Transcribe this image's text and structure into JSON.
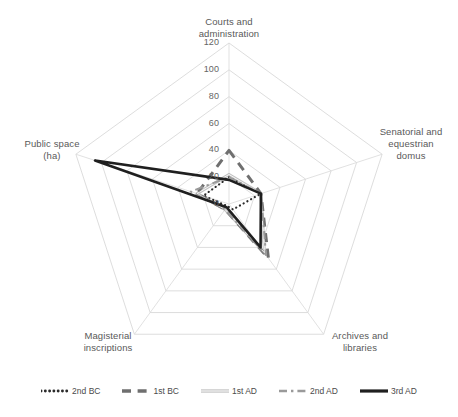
{
  "chart_data": {
    "type": "radar",
    "title": "",
    "categories": [
      "Courts and administration",
      "Senatorial and equestrian domus",
      "Archives and libraries",
      "Magisterial inscriptions",
      "Public space (ha)"
    ],
    "tick_labels": [
      "0",
      "20",
      "40",
      "60",
      "80",
      "100",
      "120"
    ],
    "rmin": 0,
    "rmax": 120,
    "rstep": 20,
    "grid": true,
    "legend_position": "bottom",
    "series": [
      {
        "name": "2nd BC",
        "style": "dotted",
        "color": "#2b2b2b",
        "width": 2.2,
        "values": [
          20,
          25,
          5,
          2,
          20
        ]
      },
      {
        "name": "1st BC",
        "style": "dashed",
        "color": "#6f6f6f",
        "width": 3.0,
        "values": [
          40,
          25,
          50,
          5,
          25
        ]
      },
      {
        "name": "1st AD",
        "style": "solid-thin",
        "color": "#8f8f8f",
        "width": 1.6,
        "values": [
          22,
          25,
          45,
          5,
          25
        ]
      },
      {
        "name": "2nd AD",
        "style": "dash-dot",
        "color": "#9a9a9a",
        "width": 2.0,
        "values": [
          20,
          25,
          47,
          5,
          30
        ]
      },
      {
        "name": "3rd AD",
        "style": "solid-thick",
        "color": "#1f1f1f",
        "width": 2.6,
        "values": [
          18,
          25,
          40,
          3,
          105
        ]
      }
    ]
  },
  "axis_labels": {
    "courts_line1": "Courts and",
    "courts_line2": "administration",
    "senatorial_line1": "Senatorial and",
    "senatorial_line2": "equestrian",
    "senatorial_line3": "domus",
    "archives_line1": "Archives and",
    "archives_line2": "libraries",
    "magisterial_line1": "Magisterial",
    "magisterial_line2": "inscriptions",
    "public_line1": "Public space",
    "public_line2": "(ha)"
  },
  "legend": {
    "items": [
      {
        "label": "2nd BC"
      },
      {
        "label": "1st BC"
      },
      {
        "label": "1st AD"
      },
      {
        "label": "2nd AD"
      },
      {
        "label": "3rd AD"
      }
    ]
  },
  "colors": {
    "grid": "#d9d9d9",
    "text": "#595959",
    "background": "#ffffff"
  }
}
